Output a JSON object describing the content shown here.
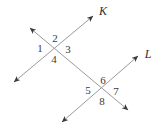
{
  "figure": {
    "width": 158,
    "height": 131,
    "background_color": "#ffffff",
    "line_color": "#9a9a9a",
    "arrow_color": "#3a3a3a",
    "label_color": "#3a3a3a",
    "line_width": 1
  },
  "lines": [
    {
      "name": "line-k",
      "label": "K",
      "label_x": 103,
      "label_y": 12,
      "x1": 14,
      "y1": 82,
      "x2": 93,
      "y2": 16,
      "arrow_start": true,
      "arrow_end": true
    },
    {
      "name": "line-l",
      "label": "L",
      "label_x": 148,
      "label_y": 55,
      "x1": 62,
      "y1": 122,
      "x2": 138,
      "y2": 56,
      "arrow_start": true,
      "arrow_end": true
    },
    {
      "name": "transversal-upper-left",
      "label": "",
      "label_x": 0,
      "label_y": 0,
      "x1": 30,
      "y1": 28,
      "x2": 128,
      "y2": 110,
      "arrow_start": true,
      "arrow_end": true
    }
  ],
  "intersections": [
    {
      "name": "intersection-upper",
      "x": 55,
      "y": 49
    },
    {
      "name": "intersection-lower",
      "x": 102,
      "y": 91
    }
  ],
  "angles": [
    {
      "id": "1",
      "label": "1",
      "x": 40,
      "y": 49,
      "intersection": "intersection-upper",
      "position": "left"
    },
    {
      "id": "2",
      "label": "2",
      "x": 55,
      "y": 39,
      "intersection": "intersection-upper",
      "position": "top"
    },
    {
      "id": "3",
      "label": "3",
      "x": 68,
      "y": 50,
      "intersection": "intersection-upper",
      "position": "right"
    },
    {
      "id": "4",
      "label": "4",
      "x": 54,
      "y": 60,
      "intersection": "intersection-upper",
      "position": "bottom"
    },
    {
      "id": "5",
      "label": "5",
      "x": 88,
      "y": 91,
      "intersection": "intersection-lower",
      "position": "left"
    },
    {
      "id": "6",
      "label": "6",
      "x": 103,
      "y": 81,
      "intersection": "intersection-lower",
      "position": "top"
    },
    {
      "id": "7",
      "label": "7",
      "x": 116,
      "y": 92,
      "intersection": "intersection-lower",
      "position": "right"
    },
    {
      "id": "8",
      "label": "8",
      "x": 102,
      "y": 102,
      "intersection": "intersection-lower",
      "position": "bottom"
    }
  ]
}
